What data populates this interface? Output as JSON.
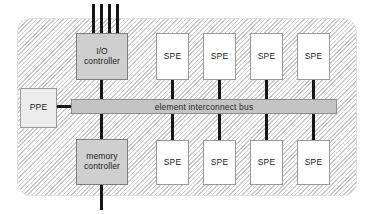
{
  "diagram": {
    "package_label": "",
    "colors": {
      "hatch_line": "#c9c9c9",
      "block_dark": "#cfcfcf",
      "block_light": "#ececec",
      "block_white": "#ffffff",
      "bus_fill": "#c4c4c4",
      "wire": "#161616",
      "text": "#1b1b1b"
    },
    "bus": {
      "label": "element interconnect bus"
    },
    "blocks": {
      "io_controller": {
        "line1": "I/O",
        "line2": "controller"
      },
      "memory_controller": {
        "line1": "memory",
        "line2": "controller"
      },
      "ppe": {
        "label": "PPE"
      }
    },
    "spe_top": [
      {
        "label": "SPE"
      },
      {
        "label": "SPE"
      },
      {
        "label": "SPE"
      },
      {
        "label": "SPE"
      }
    ],
    "spe_bottom": [
      {
        "label": "SPE"
      },
      {
        "label": "SPE"
      },
      {
        "label": "SPE"
      },
      {
        "label": "SPE"
      }
    ],
    "external_io_lines": 4
  }
}
